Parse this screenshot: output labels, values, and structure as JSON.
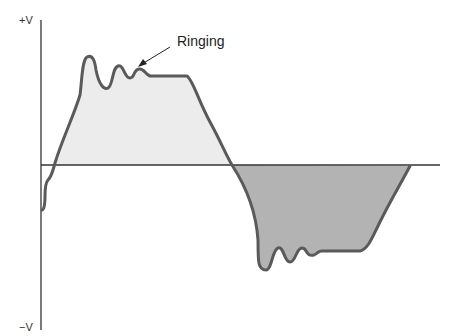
{
  "diagram": {
    "type": "waveform",
    "axis": {
      "top_label": "+V",
      "bottom_label": "−V"
    },
    "annotation": {
      "label": "Ringing"
    },
    "colors": {
      "positive_fill": "#ececec",
      "negative_fill": "#b3b3b3",
      "stroke": "#5a5a5a",
      "axis": "#333333"
    }
  }
}
